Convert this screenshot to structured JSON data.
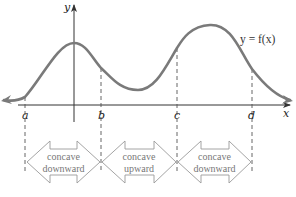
{
  "diagram": {
    "type": "concavity-diagram",
    "curve_label": "y = f(x)",
    "axes": {
      "x_label": "x",
      "y_label": "y"
    },
    "points": [
      {
        "id": "a",
        "label": "a"
      },
      {
        "id": "b",
        "label": "b"
      },
      {
        "id": "c",
        "label": "c"
      },
      {
        "id": "d",
        "label": "d"
      }
    ],
    "intervals": [
      {
        "from": "a",
        "to": "b",
        "line1": "concave",
        "line2": "downward"
      },
      {
        "from": "b",
        "to": "c",
        "line1": "concave",
        "line2": "upward"
      },
      {
        "from": "c",
        "to": "d",
        "line1": "concave",
        "line2": "downward"
      }
    ],
    "colors": {
      "curve": "#7a7a7a",
      "axes": "#333333",
      "dashed": "#555555",
      "interval_arrow": "#9a9a9a"
    }
  }
}
